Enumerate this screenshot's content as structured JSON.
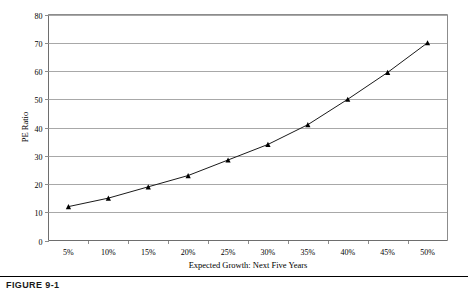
{
  "figure": {
    "caption": "FIGURE 9-1"
  },
  "chart_data": {
    "type": "line",
    "title": "",
    "xlabel": "Expected Growth: Next Five Years",
    "ylabel": "PE Ratio",
    "categories": [
      "5%",
      "10%",
      "15%",
      "20%",
      "25%",
      "30%",
      "35%",
      "40%",
      "45%",
      "50%"
    ],
    "x": [
      5,
      10,
      15,
      20,
      25,
      30,
      35,
      40,
      45,
      50
    ],
    "values": [
      12,
      15,
      19,
      23,
      28.5,
      34,
      41,
      50,
      59.5,
      70
    ],
    "series": [
      {
        "name": "PE Ratio",
        "values": [
          12,
          15,
          19,
          23,
          28.5,
          34,
          41,
          50,
          59.5,
          70
        ]
      }
    ],
    "ylim": [
      0,
      80
    ],
    "yticks": [
      0,
      10,
      20,
      30,
      40,
      50,
      60,
      70,
      80
    ],
    "ytick_labels": [
      "0",
      "10",
      "20",
      "30",
      "40",
      "50",
      "60",
      "70",
      "80"
    ],
    "grid": "horizontal",
    "legend": "none",
    "marker": "triangle",
    "line_color": "#1a1a1a",
    "grid_color": "#a8a8a8"
  }
}
